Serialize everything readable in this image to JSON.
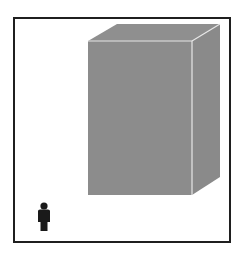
{
  "diagram": {
    "type": "scale-comparison",
    "elements": [
      {
        "id": "box",
        "kind": "3d-rectangular-prism",
        "color": "#8c8c8c",
        "edge_color": "#e6e6e6"
      },
      {
        "id": "person",
        "kind": "human-silhouette",
        "color": "#1a1a1a"
      }
    ],
    "frame_color": "#1f1f1f",
    "background": "#ffffff"
  }
}
